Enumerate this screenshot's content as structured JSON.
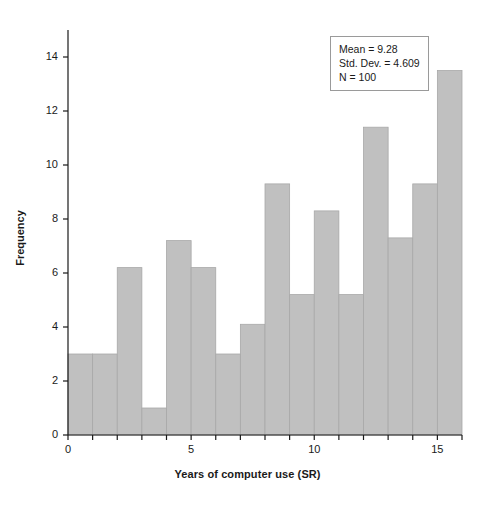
{
  "chart_data": {
    "type": "bar",
    "title": "",
    "subtitle": "",
    "xlabel": "Years of computer use (SR)",
    "ylabel": "Frequency",
    "xlim": [
      0,
      16
    ],
    "ylim": [
      0,
      15
    ],
    "xticks": [
      0,
      5,
      10,
      15
    ],
    "xtick_labels": [
      "0",
      "5",
      "10",
      "15"
    ],
    "yticks": [
      0,
      2,
      4,
      6,
      8,
      10,
      12,
      14
    ],
    "ytick_labels": [
      "0",
      "2",
      "4",
      "6",
      "8",
      "10",
      "12",
      "14"
    ],
    "grid": false,
    "legend": false,
    "bin_width": 1,
    "bin_edges": [
      0,
      1,
      2,
      3,
      4,
      5,
      6,
      7,
      8,
      9,
      10,
      11,
      12,
      13,
      14,
      15,
      16
    ],
    "categories": [
      "0-1",
      "1-2",
      "2-3",
      "3-4",
      "4-5",
      "5-6",
      "6-7",
      "7-8",
      "8-9",
      "9-10",
      "10-11",
      "11-12",
      "12-13",
      "13-14",
      "14-15",
      "15-16"
    ],
    "values": [
      3.0,
      3.0,
      6.2,
      1.0,
      7.2,
      6.2,
      3.0,
      4.1,
      9.3,
      5.2,
      8.3,
      5.2,
      11.4,
      7.3,
      9.3,
      13.5
    ],
    "bar_color": "#c0c0c0",
    "bar_edge_color": "#a8a8a8",
    "annotations": {
      "mean_label": "Mean = 9.28",
      "stddev_label": "Std. Dev. = 4.609",
      "n_label": "N = 100"
    }
  },
  "stats_box": {
    "mean": "Mean = 9.28",
    "std_dev": "Std. Dev. = 4.609",
    "n": "N = 100"
  },
  "axes": {
    "x_title": "Years of computer use (SR)",
    "y_title": "Frequency"
  }
}
